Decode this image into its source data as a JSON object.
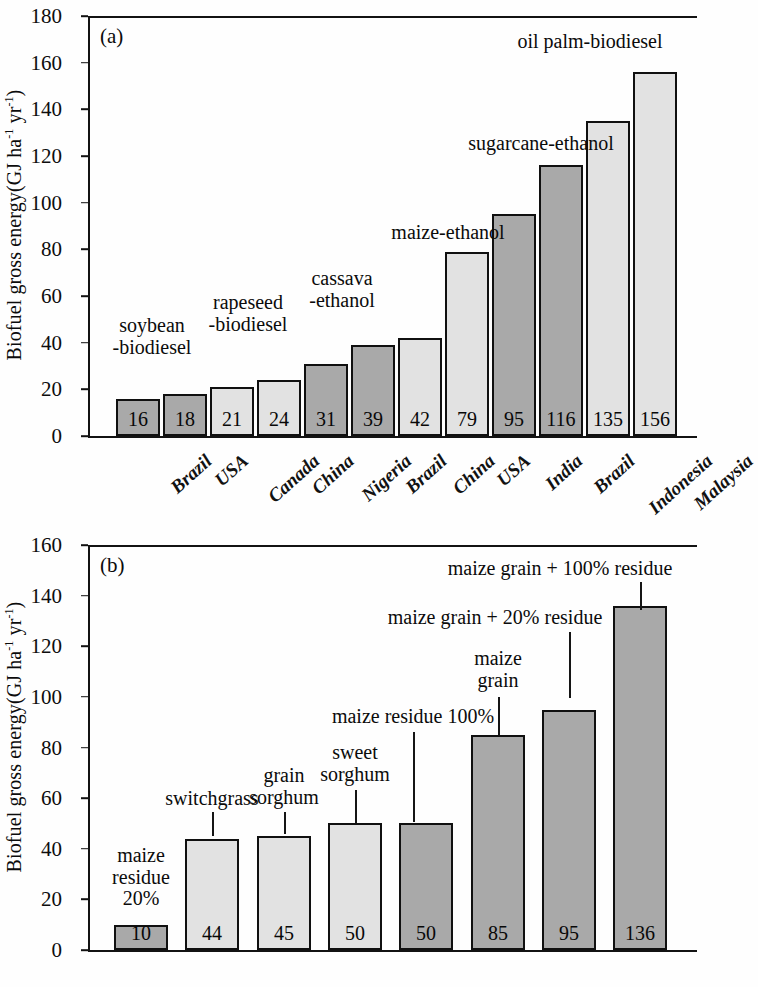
{
  "figure": {
    "y_axis_title": "Biofuel gross energy(GJ  ha",
    "y_axis_title_sup1": "-1",
    "y_axis_title_mid": " yr",
    "y_axis_title_sup2": "-1",
    "y_axis_title_end": ")"
  },
  "panel_a": {
    "letter": "(a)",
    "yticks": [
      "0",
      "20",
      "40",
      "60",
      "80",
      "100",
      "120",
      "140",
      "160",
      "180"
    ],
    "annotations": [
      {
        "text": "soybean\n-biodiesel"
      },
      {
        "text": "rapeseed\n-biodiesel"
      },
      {
        "text": "cassava\n-ethanol"
      },
      {
        "text": "maize-ethanol"
      },
      {
        "text": "sugarcane-ethanol"
      },
      {
        "text": "oil palm-biodiesel"
      }
    ]
  },
  "panel_b": {
    "letter": "(b)",
    "yticks": [
      "0",
      "20",
      "40",
      "60",
      "80",
      "100",
      "120",
      "140",
      "160"
    ],
    "annotations": [
      {
        "text": "maize\nresidue\n20%"
      },
      {
        "text": "switchgrass"
      },
      {
        "text": "grain\nsorghum"
      },
      {
        "text": "sweet\nsorghum"
      },
      {
        "text": "maize residue 100%"
      },
      {
        "text": "maize\ngrain"
      },
      {
        "text": "maize grain + 20% residue"
      },
      {
        "text": "maize grain + 100% residue"
      }
    ]
  },
  "chart_data": [
    {
      "type": "bar",
      "panel": "(a)",
      "title": "",
      "xlabel": "",
      "ylabel": "Biofuel gross energy(GJ ha-1 yr-1)",
      "ylim": [
        0,
        180
      ],
      "ytick_step": 20,
      "grid": false,
      "legend": "none",
      "categories": [
        "Brazil",
        "USA",
        "Canada",
        "China",
        "Nigeria",
        "Brazil",
        "China",
        "USA",
        "India",
        "Brazil",
        "Indonesia",
        "Malaysia"
      ],
      "values": [
        16,
        18,
        21,
        24,
        31,
        39,
        42,
        79,
        95,
        116,
        135,
        156
      ],
      "bar_shades": [
        "dark",
        "dark",
        "light",
        "light",
        "dark",
        "dark",
        "light",
        "light",
        "dark",
        "dark",
        "light",
        "light"
      ],
      "bar_labels": [
        "16",
        "18",
        "21",
        "24",
        "31",
        "39",
        "42",
        "79",
        "95",
        "116",
        "135",
        "156"
      ],
      "annotations": [
        {
          "label": "soybean -biodiesel",
          "applies_to": [
            "Brazil",
            "USA"
          ]
        },
        {
          "label": "rapeseed -biodiesel",
          "applies_to": [
            "Canada",
            "China"
          ]
        },
        {
          "label": "cassava -ethanol",
          "applies_to": [
            "Nigeria",
            "Brazil"
          ]
        },
        {
          "label": "maize-ethanol",
          "applies_to": [
            "China",
            "USA"
          ]
        },
        {
          "label": "sugarcane-ethanol",
          "applies_to": [
            "India",
            "Brazil"
          ]
        },
        {
          "label": "oil palm-biodiesel",
          "applies_to": [
            "Indonesia",
            "Malaysia"
          ]
        }
      ]
    },
    {
      "type": "bar",
      "panel": "(b)",
      "title": "",
      "xlabel": "",
      "ylabel": "Biofuel gross energy(GJ ha-1 yr-1)",
      "ylim": [
        0,
        160
      ],
      "ytick_step": 20,
      "grid": false,
      "legend": "none",
      "categories": [
        "maize residue 20%",
        "switchgrass",
        "grain sorghum",
        "sweet sorghum",
        "maize residue 100%",
        "maize grain",
        "maize grain + 20% residue",
        "maize grain + 100% residue"
      ],
      "values": [
        10,
        44,
        45,
        50,
        50,
        85,
        95,
        136
      ],
      "bar_shades": [
        "dark",
        "light",
        "light",
        "light",
        "dark",
        "dark",
        "dark",
        "dark"
      ],
      "bar_labels": [
        "10",
        "44",
        "45",
        "50",
        "50",
        "85",
        "95",
        "136"
      ]
    }
  ]
}
